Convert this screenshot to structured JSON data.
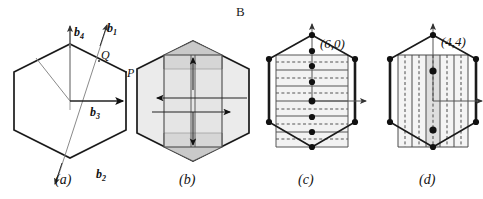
{
  "figure": {
    "top_label": "B",
    "width": 483,
    "height": 199,
    "background": "#ffffff",
    "line_color": "#1a1a1a",
    "shade_light": "#e8e8e8",
    "shade_mid": "#d2d2d2",
    "shade_dark": "#bdbdbd",
    "thin_line_color": "#808080"
  },
  "panels": [
    {
      "id": "a",
      "caption": "(a)",
      "type": "hexagon-with-basis-vectors",
      "vectors": [
        {
          "name": "b1",
          "base": "b",
          "sub": "1"
        },
        {
          "name": "b2",
          "base": "b",
          "sub": "2"
        },
        {
          "name": "b3",
          "base": "b",
          "sub": "3"
        },
        {
          "name": "b4",
          "base": "b",
          "sub": "4"
        }
      ],
      "points": [
        {
          "name": "Q",
          "label": "Q"
        },
        {
          "name": "P",
          "label": "P"
        }
      ]
    },
    {
      "id": "b",
      "caption": "(b)",
      "type": "hexagon-with-shaded-cell",
      "arrow_count": 5
    },
    {
      "id": "c",
      "caption": "(c)",
      "type": "hexagon-zigzag-lines",
      "index_label": "(6,0)",
      "chirality": {
        "n": 6,
        "m": 0
      },
      "solid_line_count": 7,
      "dashed_line_count": 6,
      "lattice_dot_count": 9,
      "orientation": "horizontal"
    },
    {
      "id": "d",
      "caption": "(d)",
      "type": "hexagon-armchair-lines",
      "index_label": "(4,4)",
      "chirality": {
        "n": 4,
        "m": 4
      },
      "solid_line_count": 5,
      "dashed_line_count": 6,
      "lattice_dot_count": 2,
      "orientation": "vertical"
    }
  ]
}
